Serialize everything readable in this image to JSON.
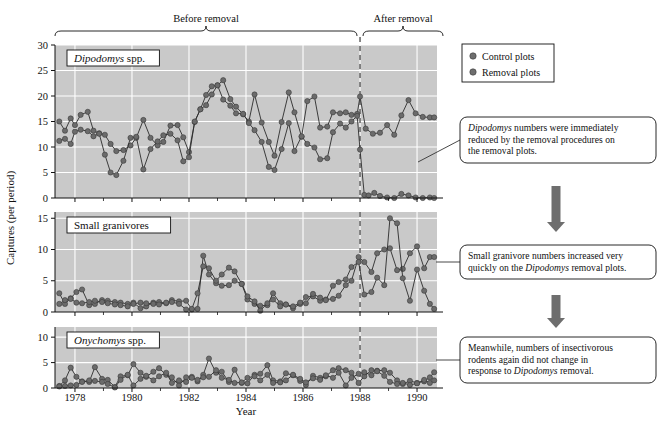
{
  "figure": {
    "ylabel": "Captures (per period)",
    "xlabel": "Year",
    "brackets": [
      {
        "label": "Before removal"
      },
      {
        "label": "After removal"
      }
    ]
  },
  "legend": {
    "items": [
      {
        "label": "Control plots",
        "color": "#6e6e6e"
      },
      {
        "label": "Removal plots",
        "color": "#6e6e6e"
      }
    ]
  },
  "annotations": [
    {
      "id": "ann-1",
      "text": "Dipodomys numbers were immediately reduced by the removal procedures on the removal plots.",
      "italic_lead": "Dipodomys",
      "rest": " numbers were immediately reduced by the removal procedures on the removal plots."
    },
    {
      "id": "ann-2",
      "text": "Small granivore numbers increased very quickly on the Dipodomys removal plots.",
      "pre": "Small granivore numbers increased very quickly on the ",
      "italic": "Dipodomys",
      "post": " removal plots."
    },
    {
      "id": "ann-3",
      "text": "Meanwhile, numbers of insectivorous rodents again did not change in response to Dipodomys removal.",
      "pre": "Meanwhile, numbers of insectivorous rodents again did not change in response to ",
      "italic": "Dipodomys",
      "post": " removal."
    }
  ],
  "colors": {
    "plot_bg": "#c9c9c9",
    "gridline": "#ffffff",
    "marker": "#6b6b6b",
    "marker_edge": "#3a3a3a",
    "line": "#2b2b2b",
    "axis": "#111111",
    "divider": "#555555",
    "arrow": "#6e6e6e"
  },
  "chart_data": {
    "type": "line",
    "title": "",
    "xlabel": "Year",
    "ylabel": "Captures (per period)",
    "xlim": [
      1977.3,
      1990.7
    ],
    "xticks": [
      1978,
      1980,
      1982,
      1984,
      1986,
      1988,
      1990
    ],
    "xtick_labels": [
      "1978",
      "1980",
      "1982",
      "1984",
      "1986",
      "1988",
      "1990"
    ],
    "grid": true,
    "legend_position": "top-right-outside",
    "removal_line_x": 1988.0,
    "panels": [
      {
        "name": "Dipodomys spp.",
        "title_italic": "Dipodomys",
        "title_rest": " spp.",
        "ylim": [
          0,
          30
        ],
        "yticks": [
          0,
          5,
          10,
          15,
          20,
          25,
          30
        ],
        "series": [
          {
            "name": "Control plots",
            "color": "#6b6b6b",
            "x": [
              1977.45,
              1977.65,
              1977.85,
              1978.0,
              1978.2,
              1978.45,
              1978.65,
              1978.85,
              1979.05,
              1979.25,
              1979.45,
              1979.7,
              1979.95,
              1980.15,
              1980.4,
              1980.65,
              1980.9,
              1981.1,
              1981.35,
              1981.6,
              1981.8,
              1982.0,
              1982.2,
              1982.4,
              1982.6,
              1982.8,
              1983.0,
              1983.2,
              1983.45,
              1983.65,
              1983.9,
              1984.1,
              1984.3,
              1984.55,
              1984.8,
              1985.0,
              1985.25,
              1985.5,
              1985.7,
              1985.95,
              1986.15,
              1986.4,
              1986.6,
              1986.85,
              1987.05,
              1987.3,
              1987.5,
              1987.7,
              1987.9,
              1988.0,
              1988.2,
              1988.45,
              1988.7,
              1988.95,
              1989.2,
              1989.45,
              1989.7,
              1989.95,
              1990.2,
              1990.45,
              1990.6
            ],
            "y": [
              15.0,
              13.2,
              15.6,
              14.3,
              16.3,
              16.9,
              13.2,
              12.7,
              12.4,
              10.6,
              9.2,
              9.4,
              10.3,
              11.8,
              15.3,
              11.8,
              10.3,
              11.0,
              14.2,
              14.3,
              11.9,
              9.0,
              14.9,
              17.4,
              20.2,
              21.9,
              22.1,
              23.1,
              19.4,
              17.9,
              16.4,
              15.0,
              20.3,
              14.8,
              11.0,
              8.3,
              14.9,
              20.7,
              16.8,
              12.0,
              19.0,
              19.9,
              13.8,
              14.0,
              16.8,
              16.6,
              16.8,
              16.3,
              16.5,
              19.9,
              13.6,
              12.6,
              12.8,
              14.3,
              12.4,
              16.2,
              19.2,
              16.6,
              15.9,
              15.8,
              15.8
            ]
          },
          {
            "name": "Removal plots",
            "color": "#6b6b6b",
            "x": [
              1977.45,
              1977.65,
              1977.85,
              1978.0,
              1978.2,
              1978.45,
              1978.65,
              1978.85,
              1979.05,
              1979.25,
              1979.45,
              1979.7,
              1979.95,
              1980.15,
              1980.4,
              1980.65,
              1980.9,
              1981.1,
              1981.35,
              1981.6,
              1981.8,
              1982.0,
              1982.2,
              1982.4,
              1982.6,
              1982.8,
              1983.0,
              1983.2,
              1983.45,
              1983.65,
              1983.9,
              1984.1,
              1984.3,
              1984.55,
              1984.8,
              1985.0,
              1985.25,
              1985.5,
              1985.7,
              1985.95,
              1986.15,
              1986.4,
              1986.6,
              1986.85,
              1987.05,
              1987.3,
              1987.5,
              1987.7,
              1987.9,
              1988.0,
              1988.15,
              1988.3,
              1988.5,
              1988.7,
              1988.95,
              1989.2,
              1989.45,
              1989.7,
              1989.95,
              1990.2,
              1990.45,
              1990.6
            ],
            "y": [
              11.2,
              11.6,
              10.6,
              13.0,
              13.4,
              13.1,
              12.1,
              12.6,
              8.5,
              5.0,
              4.5,
              7.3,
              11.8,
              12.0,
              5.6,
              9.6,
              11.1,
              12.3,
              12.6,
              11.3,
              7.2,
              8.0,
              15.0,
              17.4,
              18.2,
              20.3,
              22.1,
              19.3,
              18.1,
              16.6,
              16.5,
              14.7,
              13.3,
              11.0,
              6.1,
              5.5,
              9.6,
              14.7,
              9.2,
              12.1,
              10.6,
              9.9,
              7.6,
              7.8,
              12.9,
              14.6,
              13.8,
              15.0,
              16.1,
              9.5,
              0.6,
              0.5,
              1.0,
              0.4,
              0.1,
              0.0,
              0.8,
              0.5,
              0.1,
              0.0,
              0.1,
              0.0
            ]
          }
        ]
      },
      {
        "name": "Small granivores",
        "title_italic": "",
        "title_rest": "Small granivores",
        "ylim": [
          0,
          16
        ],
        "yticks": [
          0,
          5,
          10,
          15
        ],
        "series": [
          {
            "name": "Control plots",
            "color": "#6b6b6b",
            "x": [
              1977.45,
              1977.65,
              1977.85,
              1978.05,
              1978.25,
              1978.5,
              1978.7,
              1978.95,
              1979.15,
              1979.4,
              1979.6,
              1979.85,
              1980.05,
              1980.3,
              1980.5,
              1980.75,
              1980.95,
              1981.2,
              1981.4,
              1981.65,
              1981.9,
              1982.1,
              1982.3,
              1982.5,
              1982.7,
              1982.95,
              1983.15,
              1983.4,
              1983.6,
              1983.85,
              1984.05,
              1984.3,
              1984.5,
              1984.75,
              1984.95,
              1985.2,
              1985.4,
              1985.65,
              1985.9,
              1986.1,
              1986.35,
              1986.6,
              1986.8,
              1987.05,
              1987.25,
              1987.5,
              1987.7,
              1987.95,
              1988.15,
              1988.4,
              1988.6,
              1988.85,
              1989.05,
              1989.3,
              1989.5,
              1989.75,
              1990.0,
              1990.25,
              1990.45,
              1990.6
            ],
            "y": [
              3.0,
              1.3,
              2.2,
              3.2,
              3.6,
              1.1,
              1.3,
              1.9,
              1.8,
              1.6,
              1.5,
              1.3,
              1.5,
              0.6,
              0.9,
              1.5,
              1.6,
              1.4,
              1.9,
              1.7,
              1.8,
              0.4,
              0.5,
              9.0,
              6.0,
              4.6,
              4.2,
              4.3,
              5.0,
              4.5,
              2.0,
              1.3,
              1.0,
              1.1,
              3.0,
              1.4,
              1.2,
              0.6,
              1.3,
              2.4,
              2.5,
              1.8,
              2.0,
              2.1,
              2.6,
              4.3,
              5.0,
              8.8,
              8.0,
              6.4,
              9.4,
              10.0,
              10.2,
              6.7,
              6.9,
              9.4,
              10.5,
              7.0,
              8.8,
              8.8
            ]
          },
          {
            "name": "Removal plots",
            "color": "#6b6b6b",
            "x": [
              1977.45,
              1977.65,
              1977.85,
              1978.05,
              1978.25,
              1978.5,
              1978.7,
              1978.95,
              1979.15,
              1979.4,
              1979.6,
              1979.85,
              1980.05,
              1980.3,
              1980.5,
              1980.75,
              1980.95,
              1981.2,
              1981.4,
              1981.65,
              1981.9,
              1982.1,
              1982.3,
              1982.5,
              1982.7,
              1982.95,
              1983.15,
              1983.4,
              1983.6,
              1983.85,
              1984.05,
              1984.3,
              1984.5,
              1984.75,
              1984.95,
              1985.2,
              1985.4,
              1985.65,
              1985.9,
              1986.1,
              1986.35,
              1986.6,
              1986.8,
              1987.05,
              1987.25,
              1987.5,
              1987.7,
              1987.95,
              1988.15,
              1988.4,
              1988.6,
              1988.85,
              1989.05,
              1989.3,
              1989.5,
              1989.75,
              1990.0,
              1990.25,
              1990.45,
              1990.6
            ],
            "y": [
              1.3,
              1.9,
              2.1,
              1.5,
              1.4,
              1.6,
              1.8,
              1.6,
              1.4,
              1.2,
              1.1,
              0.9,
              1.3,
              1.5,
              1.4,
              1.3,
              1.2,
              1.5,
              1.6,
              1.3,
              0.4,
              0.5,
              3.0,
              7.3,
              7.0,
              5.0,
              6.0,
              7.1,
              6.5,
              4.5,
              2.5,
              1.7,
              0.2,
              1.4,
              2.0,
              0.9,
              1.2,
              0.9,
              1.5,
              1.4,
              2.9,
              2.3,
              1.9,
              4.2,
              4.8,
              5.2,
              7.2,
              8.0,
              2.8,
              3.2,
              5.5,
              4.3,
              15.0,
              14.2,
              5.4,
              1.8,
              6.8,
              3.4,
              1.3,
              0.5
            ]
          }
        ]
      },
      {
        "name": "Onychomys spp.",
        "title_italic": "Onychomys",
        "title_rest": " spp.",
        "ylim": [
          0,
          12
        ],
        "yticks": [
          0,
          5,
          10
        ],
        "series": [
          {
            "name": "Control plots",
            "color": "#6b6b6b",
            "x": [
              1977.45,
              1977.65,
              1977.85,
              1978.05,
              1978.25,
              1978.5,
              1978.7,
              1978.95,
              1979.15,
              1979.4,
              1979.6,
              1979.85,
              1980.05,
              1980.3,
              1980.5,
              1980.75,
              1980.95,
              1981.2,
              1981.4,
              1981.65,
              1981.9,
              1982.1,
              1982.3,
              1982.5,
              1982.7,
              1982.95,
              1983.15,
              1983.4,
              1983.6,
              1983.85,
              1984.05,
              1984.3,
              1984.5,
              1984.75,
              1984.95,
              1985.2,
              1985.4,
              1985.65,
              1985.9,
              1986.1,
              1986.35,
              1986.6,
              1986.8,
              1987.05,
              1987.25,
              1987.5,
              1987.7,
              1987.95,
              1988.15,
              1988.4,
              1988.6,
              1988.85,
              1989.05,
              1989.3,
              1989.5,
              1989.75,
              1990.0,
              1990.25,
              1990.45,
              1990.6
            ],
            "y": [
              0.4,
              1.5,
              4.0,
              2.2,
              1.3,
              1.2,
              4.1,
              1.8,
              1.6,
              0.2,
              2.3,
              2.5,
              4.7,
              3.0,
              2.2,
              3.2,
              3.9,
              2.6,
              2.1,
              0.5,
              2.1,
              2.2,
              1.3,
              2.6,
              5.8,
              3.0,
              3.2,
              1.2,
              3.6,
              1.0,
              0.9,
              2.6,
              2.8,
              4.5,
              1.5,
              1.3,
              2.9,
              2.5,
              1.4,
              0.6,
              2.4,
              2.0,
              2.3,
              3.5,
              3.9,
              3.5,
              3.0,
              1.0,
              2.3,
              3.5,
              3.4,
              3.5,
              3.0,
              1.5,
              0.8,
              1.4,
              1.0,
              1.3,
              2.1,
              3.1
            ]
          },
          {
            "name": "Removal plots",
            "color": "#6b6b6b",
            "x": [
              1977.45,
              1977.65,
              1977.85,
              1978.05,
              1978.25,
              1978.5,
              1978.7,
              1978.95,
              1979.15,
              1979.4,
              1979.6,
              1979.85,
              1980.05,
              1980.3,
              1980.5,
              1980.75,
              1980.95,
              1981.2,
              1981.4,
              1981.65,
              1981.9,
              1982.1,
              1982.3,
              1982.5,
              1982.7,
              1982.95,
              1983.15,
              1983.4,
              1983.6,
              1983.85,
              1984.05,
              1984.3,
              1984.5,
              1984.75,
              1984.95,
              1985.2,
              1985.4,
              1985.65,
              1985.9,
              1986.1,
              1986.35,
              1986.6,
              1986.8,
              1987.05,
              1987.25,
              1987.5,
              1987.7,
              1987.95,
              1988.15,
              1988.4,
              1988.6,
              1988.85,
              1989.05,
              1989.3,
              1989.5,
              1989.75,
              1990.0,
              1990.25,
              1990.45,
              1990.6
            ],
            "y": [
              0.3,
              0.4,
              0.5,
              0.6,
              1.2,
              1.5,
              1.4,
              1.2,
              0.8,
              0.1,
              1.6,
              2.6,
              0.5,
              1.8,
              2.4,
              1.5,
              2.3,
              3.0,
              1.0,
              1.5,
              1.2,
              2.0,
              1.6,
              2.1,
              2.2,
              3.5,
              2.0,
              1.6,
              1.0,
              1.1,
              2.0,
              2.3,
              1.5,
              2.6,
              1.0,
              1.1,
              1.5,
              2.6,
              1.8,
              1.1,
              1.9,
              1.6,
              2.5,
              2.0,
              3.0,
              0.5,
              2.0,
              2.8,
              3.1,
              2.5,
              3.3,
              2.4,
              1.2,
              0.8,
              1.0,
              0.6,
              0.9,
              1.6,
              1.0,
              1.5
            ]
          }
        ]
      }
    ]
  }
}
